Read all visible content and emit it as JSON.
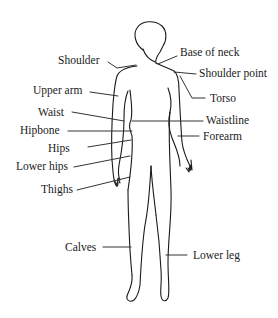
{
  "diagram": {
    "type": "labeled-body-figure",
    "labels_left": [
      {
        "id": "shoulder",
        "text": "Shoulder"
      },
      {
        "id": "upper-arm",
        "text": "Upper arm"
      },
      {
        "id": "waist",
        "text": "Waist"
      },
      {
        "id": "hipbone",
        "text": "Hipbone"
      },
      {
        "id": "hips",
        "text": "Hips"
      },
      {
        "id": "lower-hips",
        "text": "Lower hips"
      },
      {
        "id": "thighs",
        "text": "Thighs"
      },
      {
        "id": "calves",
        "text": "Calves"
      }
    ],
    "labels_right": [
      {
        "id": "base-of-neck",
        "text": "Base of neck"
      },
      {
        "id": "shoulder-point",
        "text": "Shoulder point"
      },
      {
        "id": "torso",
        "text": "Torso"
      },
      {
        "id": "waistline",
        "text": "Waistline"
      },
      {
        "id": "forearm",
        "text": "Forearm"
      },
      {
        "id": "lower-leg",
        "text": "Lower leg"
      }
    ],
    "colors": {
      "line": "#1a1a1a",
      "background": "#ffffff"
    }
  }
}
